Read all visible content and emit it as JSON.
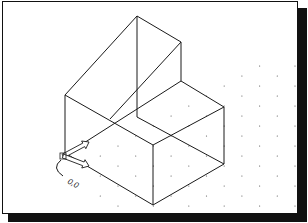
{
  "drawing": {
    "stroke_color": "#1a1a1a",
    "grid_color": "#555555",
    "edges": [
      [
        64,
        94,
        136,
        15
      ],
      [
        136,
        15,
        180,
        41
      ],
      [
        180,
        41,
        180,
        80
      ],
      [
        136,
        15,
        136,
        116
      ],
      [
        180,
        41,
        109,
        118
      ],
      [
        180,
        80,
        223,
        106
      ],
      [
        180,
        80,
        64,
        154
      ],
      [
        64,
        94,
        64,
        152
      ],
      [
        64,
        94,
        152,
        144
      ],
      [
        136,
        116,
        223,
        163
      ],
      [
        152,
        144,
        223,
        106
      ],
      [
        223,
        106,
        223,
        163
      ],
      [
        152,
        144,
        152,
        204
      ],
      [
        64,
        152,
        152,
        204
      ],
      [
        152,
        204,
        223,
        163
      ]
    ],
    "grid": {
      "origin_x": 117,
      "origin_y": 145,
      "dx": 17.7,
      "dy": 10,
      "cols": 11,
      "rows": 11,
      "min_x": 95,
      "max_y": 212,
      "min_y": 60
    },
    "ucs": {
      "origin": [
        62,
        155
      ],
      "x_axis_end": [
        88,
        141
      ],
      "y_axis_end": [
        88,
        165
      ],
      "label": "0,0",
      "label_pos": [
        66,
        182
      ]
    }
  }
}
